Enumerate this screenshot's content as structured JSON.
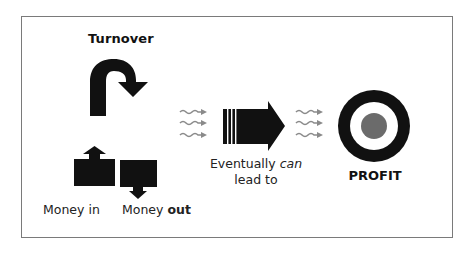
{
  "diagram": {
    "title": "Turnover",
    "money_in_label": "Money in",
    "money_out_label_prefix": "Money ",
    "money_out_label_emphasis": "out",
    "lead_line1_prefix": "Eventually ",
    "lead_line1_emphasis": "can",
    "lead_line2": "lead to",
    "outcome_label": "PROFIT",
    "icons": {
      "turnover": "u-turn-arrow-icon",
      "money_in": "box-with-up-arrow-icon",
      "money_out": "box-with-down-arrow-icon",
      "flow_left": "wavy-arrows-icon",
      "main_flow": "striped-right-arrow-icon",
      "flow_right": "wavy-arrows-icon",
      "target": "target-icon"
    },
    "colors": {
      "ink": "#111111",
      "wavy_arrows": "#8a8a8a",
      "target_center": "#6b6b6b",
      "frame_border": "#7a7a7a"
    }
  }
}
